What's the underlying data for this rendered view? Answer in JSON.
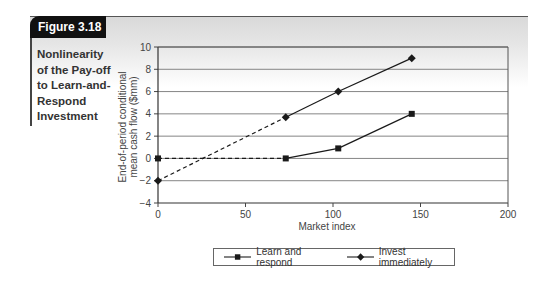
{
  "figure": {
    "label": "Figure 3.18",
    "caption": "Nonlinearity\nof the Pay-off\nto Learn-and-\nRespond\nInvestment"
  },
  "chart_data": {
    "type": "line",
    "xlabel": "Market index",
    "ylabel": "End-of-period conditional mean cash flow ($mm)",
    "ylabel_lines": [
      "End-of-period conditional",
      "mean cash flow ($mm)"
    ],
    "xlim": [
      0,
      200
    ],
    "ylim": [
      -4,
      10
    ],
    "xticks": [
      0,
      50,
      100,
      150,
      200
    ],
    "yticks": [
      -4,
      -2,
      0,
      2,
      4,
      6,
      8,
      10
    ],
    "grid": "horizontal",
    "legend_position": "bottom",
    "series": [
      {
        "name": "Learn and respond",
        "marker": "square",
        "points": [
          [
            0,
            0
          ],
          [
            73,
            0
          ],
          [
            103,
            0.9
          ],
          [
            145,
            4
          ]
        ],
        "dashed_segments": [
          [
            0,
            1
          ]
        ]
      },
      {
        "name": "Invest immediately",
        "marker": "diamond",
        "points": [
          [
            0,
            -2
          ],
          [
            73,
            3.7
          ],
          [
            103,
            6
          ],
          [
            145,
            9
          ]
        ],
        "dashed_segments": [
          [
            0,
            1
          ]
        ]
      }
    ]
  },
  "legend": {
    "items": [
      {
        "label": "Learn and respond",
        "marker": "square"
      },
      {
        "label": "Invest immediately",
        "marker": "diamond"
      }
    ]
  },
  "colors": {
    "tab_bg": "#111111",
    "line": "#1a1a1a",
    "grid": "#777777",
    "band_top": "#d9d9d9"
  }
}
